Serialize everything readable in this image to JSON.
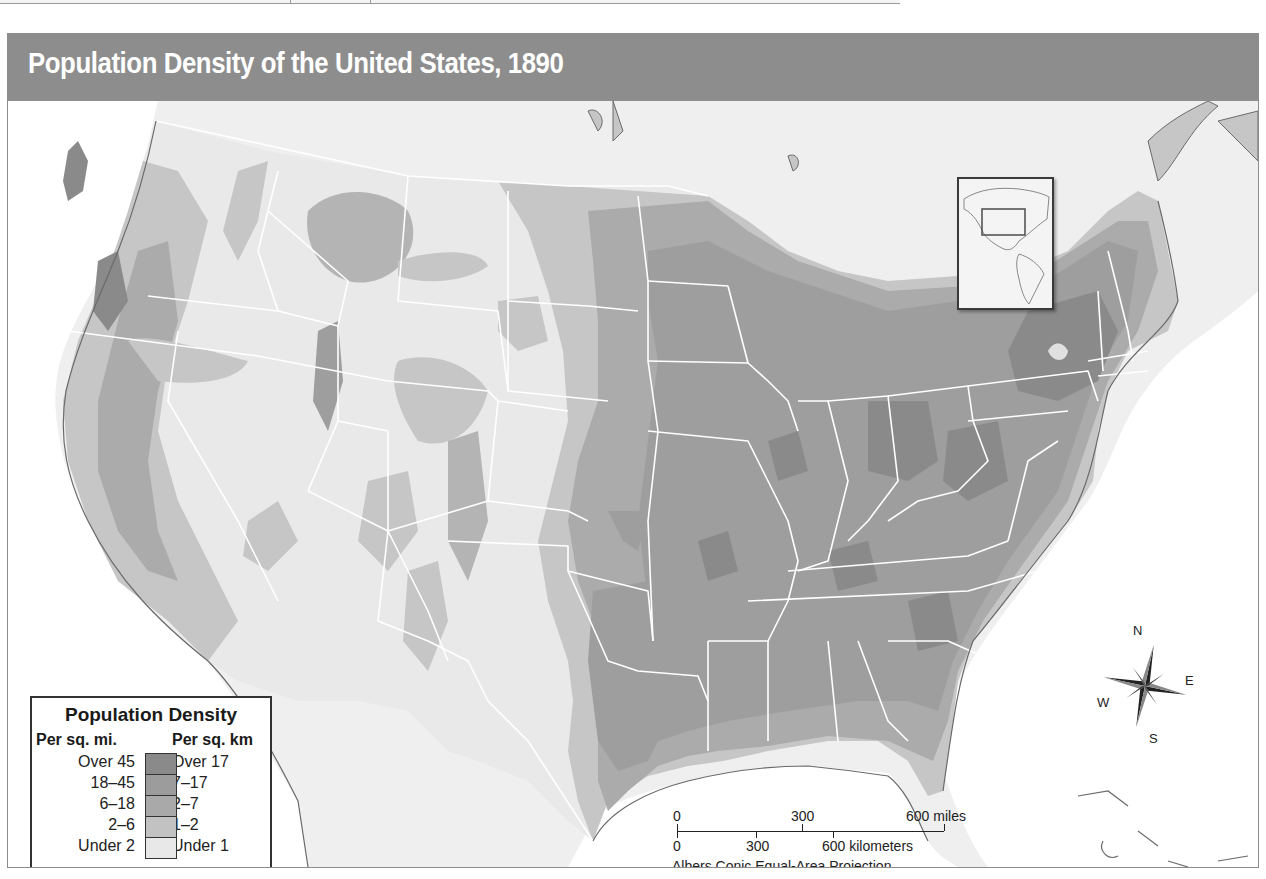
{
  "map": {
    "title": "Population Density of the United States, 1890",
    "projection": "Albers Conic Equal-Area Projection",
    "inset": {
      "description": "Locator map of the Americas with the United States highlighted"
    }
  },
  "legend": {
    "title": "Population Density",
    "col_mi": "Per sq. mi.",
    "col_km": "Per sq. km",
    "classes": [
      {
        "mi": "Over 45",
        "km": "Over 17",
        "color": "#8a8a8a"
      },
      {
        "mi": "18–45",
        "km": "7–17",
        "color": "#9c9c9c"
      },
      {
        "mi": "6–18",
        "km": "2–7",
        "color": "#a9a9a9"
      },
      {
        "mi": "2–6",
        "km": "1–2",
        "color": "#c2c2c2"
      },
      {
        "mi": "Under 2",
        "km": "Under 1",
        "color": "#e8e8e8"
      }
    ],
    "boundary_label_line1": "Present-day",
    "boundary_label_line2": "boundary"
  },
  "scale_bar": {
    "miles": {
      "start": "0",
      "mid": "300",
      "end": "600 miles"
    },
    "km": {
      "start": "0",
      "mid": "300",
      "end": "600 kilometers"
    }
  },
  "compass": {
    "n": "N",
    "s": "S",
    "e": "E",
    "w": "W"
  },
  "colors": {
    "title_bar": "#8d8d8d",
    "land_background": "#ededed",
    "water": "#ffffff",
    "boundary": "#ffffff"
  }
}
